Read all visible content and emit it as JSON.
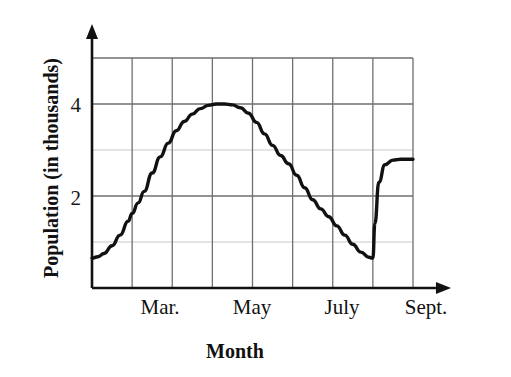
{
  "figure": {
    "title": "",
    "background_color": "#ffffff",
    "line_color": "#111111",
    "grid_color_major": "#6f6f6f",
    "grid_color_minor": "#c9c9c9",
    "axis_color": "#111111"
  },
  "axes": {
    "y_title": "Population (in thousands)",
    "x_title": "Month",
    "y_tick_labels": [
      "2",
      "4"
    ],
    "y_tick_values": [
      2,
      4
    ],
    "x_tick_labels": [
      "Mar.",
      "May",
      "July",
      "Sept."
    ]
  },
  "chart_data": {
    "type": "line",
    "title": "",
    "xlabel": "Month",
    "ylabel": "Population (in thousands)",
    "xlim": [
      0,
      8
    ],
    "ylim": [
      0,
      5
    ],
    "grid": true,
    "legend": false,
    "x_tick_labels": [
      "Mar.",
      "May",
      "July",
      "Sept."
    ],
    "x_tick_positions": [
      1.5,
      3.5,
      5.5,
      7.0
    ],
    "y_tick_labels": [
      "2",
      "4"
    ],
    "y_tick_positions": [
      2,
      4
    ],
    "y_gridlines": [
      1,
      2,
      3,
      4,
      5
    ],
    "x_gridlines": [
      0,
      1,
      2,
      3,
      4,
      5,
      6,
      7,
      8
    ],
    "annotations": [
      "Curve rises from about 0.65 at the left edge to a flat maximum of 4 near May",
      "Curve falls back to about 0.65 just before Sept.",
      "A sharp vertical jump at Sept. takes the value from about 0.65 up to about 2.8",
      "Curve stays flat at about 2.8 until the right edge"
    ],
    "series": [
      {
        "name": "Population",
        "x": [
          0.0,
          0.15,
          0.3,
          0.5,
          0.7,
          0.9,
          1.0,
          1.15,
          1.3,
          1.5,
          1.7,
          1.9,
          2.1,
          2.3,
          2.5,
          2.7,
          2.9,
          3.1,
          3.3,
          3.5,
          3.7,
          3.9,
          4.1,
          4.3,
          4.5,
          4.7,
          4.9,
          5.1,
          5.3,
          5.5,
          5.7,
          5.9,
          6.1,
          6.3,
          6.5,
          6.7,
          6.9,
          6.99,
          7.0,
          7.05,
          7.15,
          7.3,
          7.5,
          7.7,
          8.0
        ],
        "y": [
          0.65,
          0.68,
          0.75,
          0.92,
          1.15,
          1.45,
          1.62,
          1.85,
          2.1,
          2.5,
          2.85,
          3.15,
          3.42,
          3.62,
          3.78,
          3.9,
          3.97,
          4.0,
          4.0,
          3.98,
          3.92,
          3.8,
          3.6,
          3.35,
          3.1,
          2.88,
          2.7,
          2.45,
          2.18,
          1.92,
          1.72,
          1.55,
          1.35,
          1.15,
          0.95,
          0.78,
          0.67,
          0.65,
          0.65,
          1.4,
          2.3,
          2.68,
          2.78,
          2.8,
          2.8
        ]
      }
    ]
  },
  "plot_geometry": {
    "left": 92,
    "right": 413,
    "top": 58,
    "bottom": 288,
    "y_axis_arrow": true,
    "x_axis_arrow": true
  }
}
